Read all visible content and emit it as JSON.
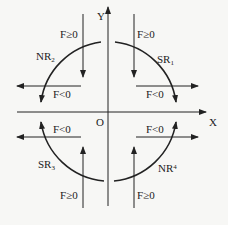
{
  "axes": {
    "x_label": "X",
    "y_label": "Y",
    "origin_label": "O"
  },
  "quadrants": {
    "q1": {
      "arc_label": "SR",
      "arc_sub": "1",
      "vertical_label": "F≥0",
      "horizontal_label": "F<0"
    },
    "q2": {
      "arc_label": "NR",
      "arc_sub": "2",
      "vertical_label": "F≥0",
      "horizontal_label": "F<0"
    },
    "q3": {
      "arc_label": "SR",
      "arc_sub": "3",
      "vertical_label": "F≥0",
      "horizontal_label": "F<0"
    },
    "q4": {
      "arc_label": "NR",
      "arc_sub": "4",
      "vertical_label": "F≥0",
      "horizontal_label": "F<0"
    }
  },
  "colors": {
    "line": "#222222",
    "background": "#f7f7f5"
  }
}
